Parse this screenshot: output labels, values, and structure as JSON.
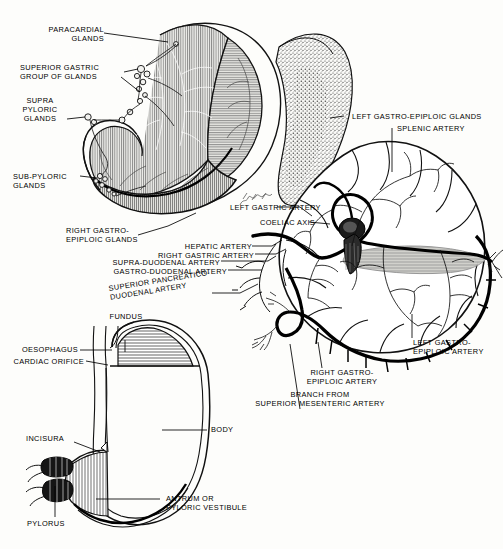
{
  "plate": {
    "title": "The Stomach: Lymph Glands, Arterial Supply and Sagittal Section",
    "background_color": "#fdfdfb",
    "ink_color": "#000000",
    "artist_signature": "signature",
    "width": 503,
    "height": 549
  },
  "figures": [
    {
      "id": "fig-stomach-glands",
      "name": "stomach-with-lymph-glands-and-spleen",
      "description": "Anterior view of stomach with lymph gland groups, spleen stippled at right"
    },
    {
      "id": "fig-omentum-arteries",
      "name": "greater-omentum-arterial-arcade",
      "description": "Greater omentum with gastro-epiploic arterial arcade and coeliac axis"
    },
    {
      "id": "fig-stomach-section",
      "name": "stomach-sagittal-section",
      "description": "Outline section of stomach showing fundus, body, antrum, pylorus"
    }
  ],
  "labels": {
    "paracardial_glands": "PARACARDIAL\nGLANDS",
    "superior_gastric_group": "SUPERIOR GASTRIC\nGROUP OF GLANDS",
    "supra_pyloric_glands": "SUPRA\nPYLORIC\nGLANDS",
    "sub_pyloric_glands": "SUB-PYLORIC\nGLANDS",
    "right_gastro_epiploic_glands": "RIGHT GASTRO-\nEPIPLOIC GLANDS",
    "left_gastro_epiploic_glands": "LEFT GASTRO-EPIPLOIC GLANDS",
    "splenic_artery": "SPLENIC ARTERY",
    "left_gastric_artery": "LEFT GASTRIC ARTERY",
    "coeliac_axis": "COELIAC AXIS",
    "hepatic_artery": "HEPATIC ARTERY",
    "right_gastric_artery": "RIGHT GASTRIC ARTERY",
    "supra_duodenal_artery": "SUPRA-DUODENAL ARTERY",
    "gastro_duodenal_artery": "GASTRO-DUODENAL ARTERY",
    "superior_pancreatico_duodenal_artery": "SUPERIOR PANCREATICO-\nDUODENAL ARTERY",
    "right_gastro_epiploic_artery": "RIGHT GASTRO-\nEPIPLOIC ARTERY",
    "left_gastro_epiploic_artery": "LEFT GASTRO-\nEPIPLOIC ARTERY",
    "branch_superior_mesenteric": "BRANCH FROM\nSUPERIOR MESENTERIC ARTERY",
    "fundus": "FUNDUS",
    "oesophagus": "OESOPHAGUS",
    "cardiac_orifice": "CARDIAC ORIFICE",
    "body": "BODY",
    "incisura": "INCISURA",
    "pylorus": "PYLORUS",
    "antrum": "ANTRUM OR\nPYLORIC VESTIBULE"
  }
}
